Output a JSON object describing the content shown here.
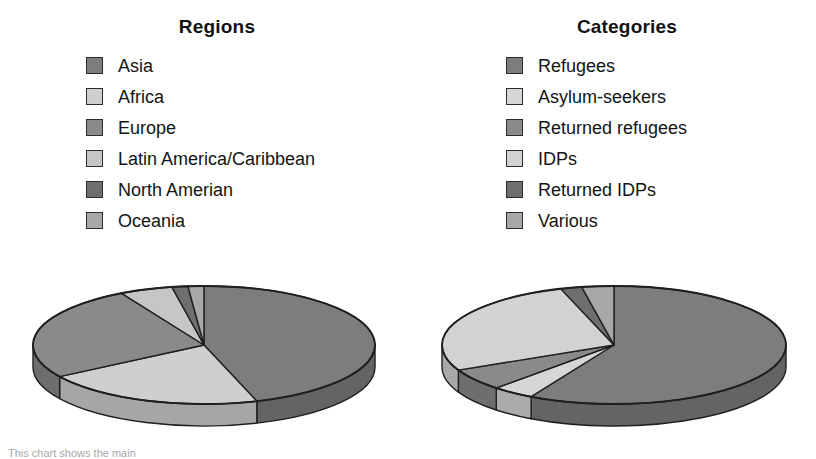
{
  "page": {
    "background": "#ffffff",
    "width": 816,
    "height": 456,
    "footnote": "This chart shows the main"
  },
  "palette": {
    "dark_1": "#7d7d7d",
    "light_1": "#cfcfcf",
    "dark_2": "#8a8a8a",
    "light_2": "#c6c6c6",
    "dark_3": "#6f6f6f",
    "light_3": "#a8a8a8",
    "outline": "#1f1f1f",
    "side_shade": "#6a6a6a",
    "text": "#141414"
  },
  "panels": [
    {
      "id": "regions",
      "title": "Regions",
      "legend": [
        {
          "label": "Asia",
          "color": "#7d7d7d"
        },
        {
          "label": "Africa",
          "color": "#cfcfcf"
        },
        {
          "label": "Europe",
          "color": "#8a8a8a"
        },
        {
          "label": "Latin America/Caribbean",
          "color": "#c6c6c6"
        },
        {
          "label": "North Amerian",
          "color": "#6f6f6f"
        },
        {
          "label": "Oceania",
          "color": "#a8a8a8"
        }
      ]
    },
    {
      "id": "categories",
      "title": "Categories",
      "legend": [
        {
          "label": "Refugees",
          "color": "#7d7d7d"
        },
        {
          "label": "Asylum-seekers",
          "color": "#d6d6d6"
        },
        {
          "label": "Returned refugees",
          "color": "#8a8a8a"
        },
        {
          "label": "IDPs",
          "color": "#d2d2d2"
        },
        {
          "label": "Returned IDPs",
          "color": "#6f6f6f"
        },
        {
          "label": "Various",
          "color": "#a8a8a8"
        }
      ]
    }
  ],
  "chart_data": [
    {
      "type": "pie",
      "id": "regions-pie",
      "title": "Regions",
      "style": "3d-pie",
      "labels": [
        "Asia",
        "Africa",
        "Europe",
        "Latin America/Caribbean",
        "North Amerian",
        "Oceania"
      ],
      "values": [
        45,
        21,
        26,
        5,
        1.5,
        1.5
      ],
      "unit": "percent",
      "colors": [
        "#7d7d7d",
        "#cfcfcf",
        "#8a8a8a",
        "#c6c6c6",
        "#6f6f6f",
        "#a8a8a8"
      ],
      "start_angle_deg": 0,
      "direction": "clockwise",
      "legend_position": "top",
      "grid": false
    },
    {
      "type": "pie",
      "id": "categories-pie",
      "title": "Categories",
      "style": "3d-pie",
      "labels": [
        "Refugees",
        "Asylum-seekers",
        "Returned refugees",
        "IDPs",
        "Returned IDPs",
        "Various"
      ],
      "values": [
        58,
        4,
        6,
        27,
        2,
        3
      ],
      "unit": "percent",
      "colors": [
        "#7d7d7d",
        "#d6d6d6",
        "#8a8a8a",
        "#d2d2d2",
        "#6f6f6f",
        "#a8a8a8"
      ],
      "start_angle_deg": 0,
      "direction": "clockwise",
      "legend_position": "top",
      "grid": false
    }
  ]
}
